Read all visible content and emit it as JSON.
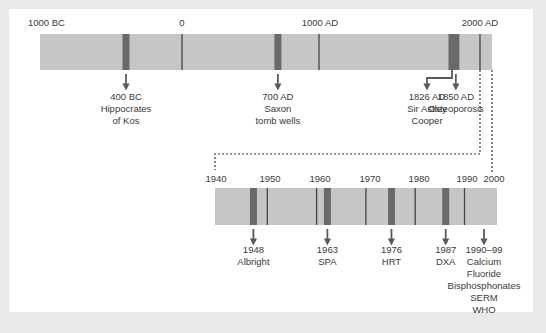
{
  "colors": {
    "background": "#e9e9e9",
    "panel": "#ffffff",
    "bar": "#c6c6c6",
    "event_band": "#6a6a6a",
    "tick_line": "#444444",
    "arrow": "#5a5a5a",
    "text": "#3a3a3a",
    "connector": "#333333"
  },
  "top_timeline": {
    "range": [
      -1000,
      2000
    ],
    "tick_labels": [
      {
        "year": -1000,
        "label": "1000 BC"
      },
      {
        "year": 0,
        "label": "0"
      },
      {
        "year": 1000,
        "label": "1000 AD"
      },
      {
        "year": 2000,
        "label": "2000 AD"
      }
    ],
    "tick_lines": [
      0,
      1000,
      2000
    ],
    "events": [
      {
        "year": -400,
        "lines": [
          "400 BC",
          "Hippocrates",
          "of Kos"
        ],
        "arrow": "down"
      },
      {
        "year": 700,
        "lines": [
          "700 AD",
          "Saxon",
          "tomb wells"
        ],
        "arrow": "down"
      },
      {
        "year": 1826,
        "lines": [
          "1826 AD",
          "Sir Astley",
          "Cooper"
        ],
        "arrow": "elbow-left"
      },
      {
        "year": 1850,
        "lines": [
          "1850 AD",
          "Osteoporosis"
        ],
        "arrow": "down"
      }
    ]
  },
  "bottom_timeline": {
    "range": [
      1940,
      2000
    ],
    "tick_labels": [
      {
        "year": 1940,
        "label": "1940"
      },
      {
        "year": 1950,
        "label": "1950"
      },
      {
        "year": 1960,
        "label": "1960"
      },
      {
        "year": 1970,
        "label": "1970"
      },
      {
        "year": 1980,
        "label": "1980"
      },
      {
        "year": 1990,
        "label": "1990"
      },
      {
        "year": 2000,
        "label": "2000"
      }
    ],
    "tick_lines": [
      1950,
      1960,
      1970,
      1980,
      1990
    ],
    "events": [
      {
        "year": 1948,
        "lines": [
          "1948",
          "Albright"
        ],
        "band": true
      },
      {
        "year": 1963,
        "lines": [
          "1963",
          "SPA"
        ],
        "band": true
      },
      {
        "year": 1976,
        "lines": [
          "1976",
          "HRT"
        ],
        "band": true
      },
      {
        "year": 1987,
        "lines": [
          "1987",
          "DXA"
        ],
        "band": true
      },
      {
        "year": 1995,
        "lines": [
          "1990–99",
          "Calcium",
          "Fluoride",
          "Bisphosphonates",
          "SERM",
          "WHO"
        ],
        "band": false
      }
    ]
  }
}
